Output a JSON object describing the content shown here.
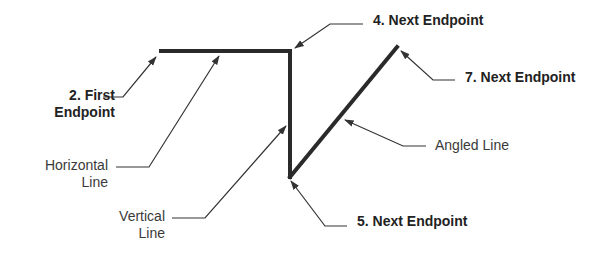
{
  "diagram": {
    "title": "",
    "colors": {
      "background": "#ffffff",
      "main_line": "#2a2a2a",
      "leader_line": "#333333",
      "text": "#2b2b2b"
    },
    "shape_lines": [
      {
        "id": "horizontal",
        "x1": 161,
        "y1": 51,
        "x2": 290,
        "y2": 51
      },
      {
        "id": "vertical",
        "x1": 290,
        "y1": 51,
        "x2": 290,
        "y2": 177
      },
      {
        "id": "angled",
        "x1": 290,
        "y1": 177,
        "x2": 397,
        "y2": 47
      }
    ],
    "labels": [
      {
        "id": "first-endpoint",
        "line1": "2.  First",
        "line2": "Endpoint",
        "style": "bold",
        "left": 20,
        "top": 87,
        "width": 95,
        "align": "right"
      },
      {
        "id": "horizontal-line",
        "line1": "Horizontal",
        "line2": "Line",
        "style": "light",
        "left": 30,
        "top": 157,
        "width": 78,
        "align": "right"
      },
      {
        "id": "vertical-line",
        "line1": "Vertical",
        "line2": "Line",
        "style": "light",
        "left": 105,
        "top": 208,
        "width": 60,
        "align": "right"
      },
      {
        "id": "next-endpoint-4",
        "line1": "4. Next Endpoint",
        "line2": "",
        "style": "bold",
        "left": 373,
        "top": 12,
        "width": 140,
        "align": "left"
      },
      {
        "id": "next-endpoint-7",
        "line1": "7. Next Endpoint",
        "line2": "",
        "style": "bold",
        "left": 465,
        "top": 69,
        "width": 140,
        "align": "left"
      },
      {
        "id": "angled-line",
        "line1": "Angled Line",
        "line2": "",
        "style": "light",
        "left": 435,
        "top": 137,
        "width": 100,
        "align": "left"
      },
      {
        "id": "next-endpoint-5",
        "line1": "5. Next Endpoint",
        "line2": "",
        "style": "bold",
        "left": 357,
        "top": 213,
        "width": 140,
        "align": "left"
      }
    ],
    "leaders": [
      {
        "id": "first-endpoint-leader",
        "points": "103,97 123,97 156,57"
      },
      {
        "id": "horizontal-line-leader",
        "points": "116,167 149,167 219,56"
      },
      {
        "id": "vertical-line-leader",
        "points": "172,218 205,218 286,126"
      },
      {
        "id": "next-endpoint-4-leader",
        "points": "363,24 330,24 295,48"
      },
      {
        "id": "next-endpoint-7-leader",
        "points": "455,80 433,80 401,51"
      },
      {
        "id": "angled-line-leader",
        "points": "426,146 403,146 345,120"
      },
      {
        "id": "next-endpoint-5-leader",
        "points": "347,226 325,226 291,181"
      }
    ]
  }
}
